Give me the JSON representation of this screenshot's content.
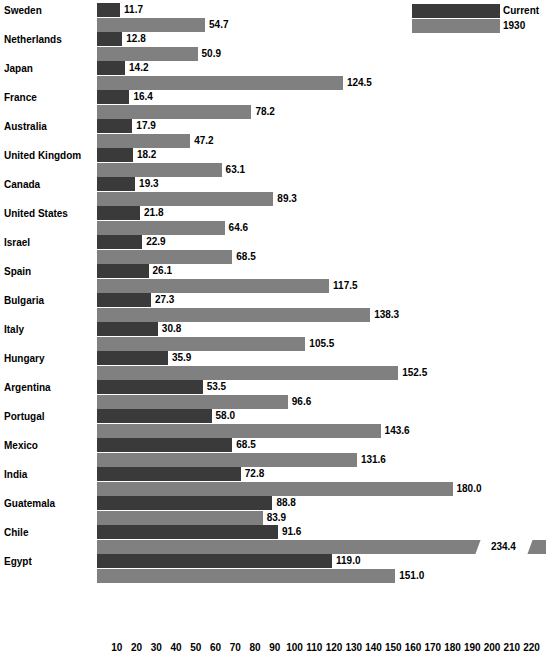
{
  "legend": {
    "entries": [
      {
        "label": "Current",
        "color": "#3a3a3a",
        "key": "current"
      },
      {
        "label": "1930",
        "color": "#808080",
        "key": "old"
      }
    ]
  },
  "axis": {
    "ticks": [
      "10",
      "20",
      "30",
      "40",
      "50",
      "60",
      "70",
      "80",
      "90",
      "100",
      "110",
      "120",
      "130",
      "140",
      "150",
      "160",
      "170",
      "180",
      "190",
      "200",
      "210",
      "220"
    ],
    "min": 0,
    "max": 225
  },
  "chart_data": {
    "type": "bar",
    "orientation": "horizontal",
    "title": "",
    "subtitle": "",
    "xlabel": "",
    "ylabel": "",
    "xlim": [
      0,
      225
    ],
    "grid": false,
    "legend_position": "top-right",
    "categories": [
      "Sweden",
      "Netherlands",
      "Japan",
      "France",
      "Australia",
      "United Kingdom",
      "Canada",
      "United States",
      "Israel",
      "Spain",
      "Bulgaria",
      "Italy",
      "Hungary",
      "Argentina",
      "Portugal",
      "Mexico",
      "India",
      "Guatemala",
      "Chile",
      "Egypt"
    ],
    "series": [
      {
        "name": "Current",
        "color": "#3a3a3a",
        "values": [
          11.7,
          12.8,
          14.2,
          16.4,
          17.9,
          18.2,
          19.3,
          21.8,
          22.9,
          26.1,
          27.3,
          30.8,
          35.9,
          53.5,
          58.0,
          68.5,
          72.8,
          88.8,
          91.6,
          119.0
        ]
      },
      {
        "name": "1930",
        "color": "#808080",
        "values": [
          54.7,
          50.9,
          124.5,
          78.2,
          47.2,
          63.1,
          89.3,
          64.6,
          68.5,
          117.5,
          138.3,
          105.5,
          152.5,
          96.6,
          143.6,
          131.6,
          180.0,
          83.9,
          234.4,
          151.0
        ]
      }
    ],
    "value_labels": {
      "Sweden": {
        "current": "11.7",
        "1930": "54.7"
      },
      "Netherlands": {
        "current": "12.8",
        "1930": "50.9"
      },
      "Japan": {
        "current": "14.2",
        "1930": "124.5"
      },
      "France": {
        "current": "16.4",
        "1930": "78.2"
      },
      "Australia": {
        "current": "17.9",
        "1930": "47.2"
      },
      "United Kingdom": {
        "current": "18.2",
        "1930": "63.1"
      },
      "Canada": {
        "current": "19.3",
        "1930": "89.3"
      },
      "United States": {
        "current": "21.8",
        "1930": "64.6"
      },
      "Israel": {
        "current": "22.9",
        "1930": "68.5"
      },
      "Spain": {
        "current": "26.1",
        "1930": "117.5"
      },
      "Bulgaria": {
        "current": "27.3",
        "1930": "138.3"
      },
      "Italy": {
        "current": "30.8",
        "1930": "105.5"
      },
      "Hungary": {
        "current": "35.9",
        "1930": "152.5"
      },
      "Argentina": {
        "current": "53.5",
        "1930": "96.6"
      },
      "Portugal": {
        "current": "58.0",
        "1930": "143.6"
      },
      "Mexico": {
        "current": "68.5",
        "1930": "131.6"
      },
      "India": {
        "current": "72.8",
        "1930": "180.0"
      },
      "Guatemala": {
        "current": "88.8",
        "1930": "83.9"
      },
      "Chile": {
        "current": "91.6",
        "1930": "234.4"
      },
      "Egypt": {
        "current": "119.0",
        "1930": "151.0"
      }
    },
    "broken_bars": [
      {
        "category": "Chile",
        "series": "1930",
        "value": 234.4,
        "label": "234.4",
        "break_at": 205
      }
    ]
  }
}
